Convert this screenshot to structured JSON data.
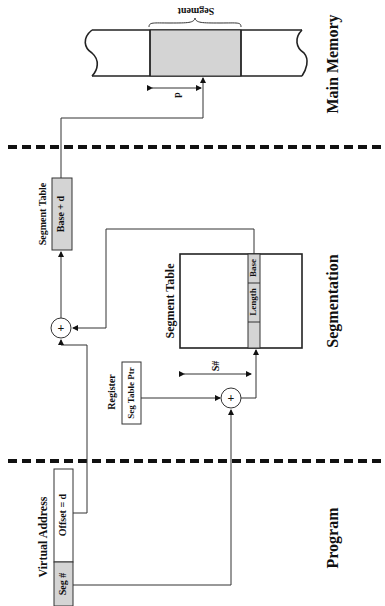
{
  "diagram": {
    "regions": {
      "main_memory": "Main Memory",
      "segmentation": "Segmentation",
      "program": "Program"
    },
    "virtual_address": {
      "label": "Virtual Address",
      "seg_field": "Seg #",
      "offset_field": "Offset = d"
    },
    "register": {
      "label": "Register",
      "value": "Seg Table Ptr"
    },
    "segment_table": {
      "label": "Segment Table",
      "entry_length": "Length",
      "entry_base": "Base",
      "index_label": "S#"
    },
    "result": {
      "label": "Segment Table",
      "value": "Base + d"
    },
    "main_memory": {
      "segment_label": "Segment",
      "offset_label": "d"
    },
    "adders": {
      "symbol": "+"
    }
  }
}
